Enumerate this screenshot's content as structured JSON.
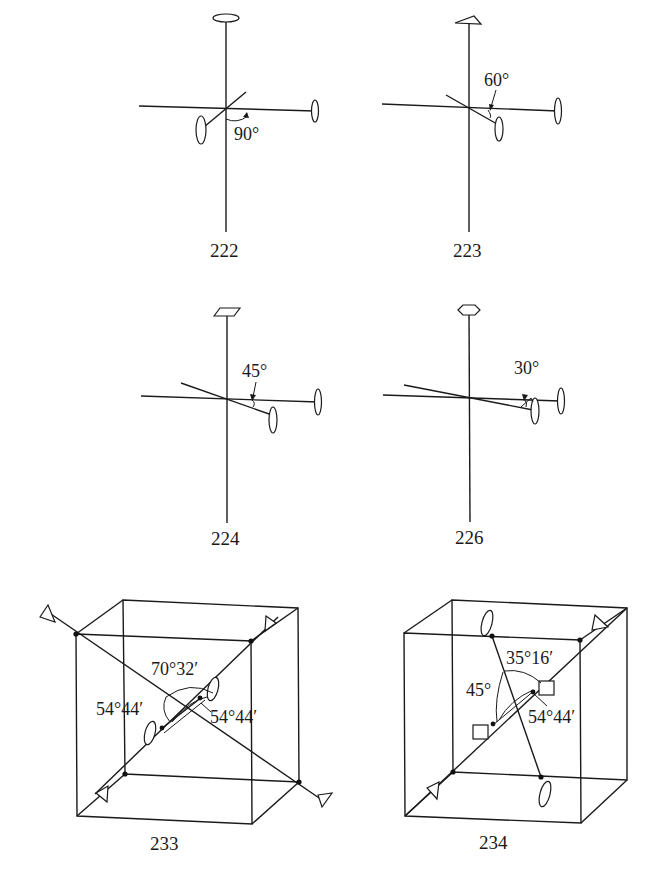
{
  "figures": [
    {
      "id": "222",
      "label": "222",
      "angle_label": "90°",
      "principal_axis_symbol": "2-fold (lens)",
      "secondary_axes": [
        "2-fold",
        "2-fold"
      ]
    },
    {
      "id": "223",
      "label": "223",
      "angle_label": "60°",
      "principal_axis_symbol": "3-fold (triangle)",
      "secondary_axes": [
        "2-fold",
        "2-fold"
      ]
    },
    {
      "id": "224",
      "label": "224",
      "angle_label": "45°",
      "principal_axis_symbol": "4-fold (square)",
      "secondary_axes": [
        "2-fold",
        "2-fold"
      ]
    },
    {
      "id": "226",
      "label": "226",
      "angle_label": "30°",
      "principal_axis_symbol": "6-fold (hexagon)",
      "secondary_axes": [
        "2-fold",
        "2-fold"
      ]
    },
    {
      "id": "233",
      "label": "233",
      "angles": [
        "70°32′",
        "54°44′",
        "54°44′"
      ],
      "axes": [
        "3-fold body diagonals",
        "2-fold"
      ]
    },
    {
      "id": "234",
      "label": "234",
      "angles": [
        "35°16′",
        "45°",
        "54°44′"
      ],
      "axes": [
        "3-fold body diagonal",
        "4-fold",
        "2-fold"
      ]
    }
  ]
}
